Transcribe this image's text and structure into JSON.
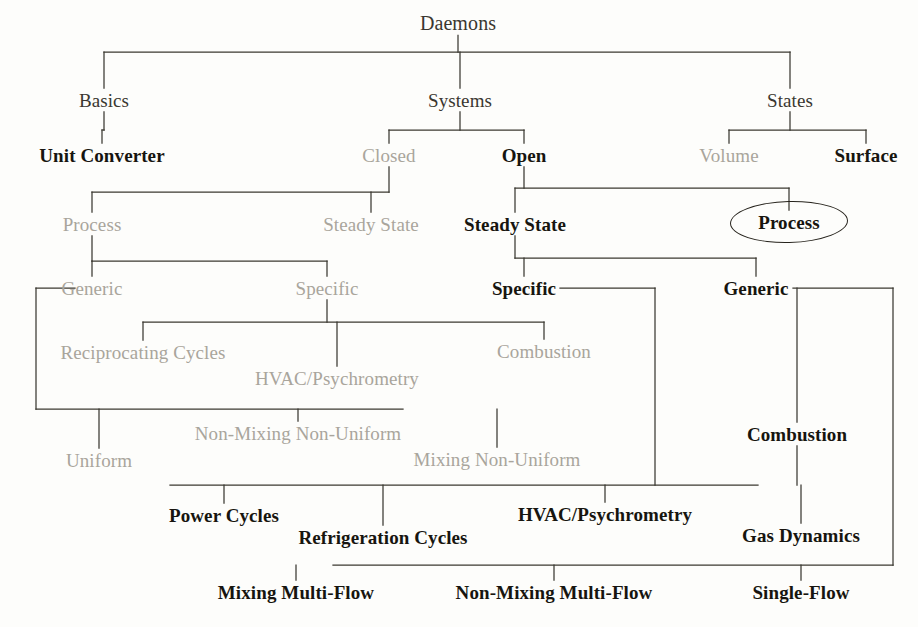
{
  "diagram": {
    "title": "Daemons",
    "type": "hierarchy-tree",
    "root_label": "Daemons",
    "highlighted_node": "Process",
    "colors": {
      "active_text": "#17150f",
      "dim_text": "#a9a59c",
      "root_text": "#3a3730",
      "line": "#3b3830",
      "background": "#fdfdfb",
      "highlight_ring": "#26231c"
    },
    "nodes": [
      {
        "id": "daemons",
        "label": "Daemons",
        "state": "root",
        "x": 458,
        "y": 23,
        "size": 20
      },
      {
        "id": "basics",
        "label": "Basics",
        "state": "root",
        "x": 104,
        "y": 100,
        "size": 19
      },
      {
        "id": "systems",
        "label": "Systems",
        "state": "root",
        "x": 460,
        "y": 100,
        "size": 19
      },
      {
        "id": "states",
        "label": "States",
        "state": "root",
        "x": 790,
        "y": 100,
        "size": 19
      },
      {
        "id": "unit-converter",
        "label": "Unit Converter",
        "state": "active",
        "x": 102,
        "y": 155,
        "size": 19
      },
      {
        "id": "closed",
        "label": "Closed",
        "state": "dim",
        "x": 389,
        "y": 155,
        "size": 19
      },
      {
        "id": "open",
        "label": "Open",
        "state": "active",
        "x": 524,
        "y": 155,
        "size": 19
      },
      {
        "id": "volume",
        "label": "Volume",
        "state": "dim",
        "x": 729,
        "y": 155,
        "size": 19
      },
      {
        "id": "surface",
        "label": "Surface",
        "state": "active",
        "x": 866,
        "y": 155,
        "size": 19
      },
      {
        "id": "closed-process",
        "label": "Process",
        "state": "dim",
        "x": 92,
        "y": 224,
        "size": 19
      },
      {
        "id": "closed-steady",
        "label": "Steady State",
        "state": "dim",
        "x": 371,
        "y": 224,
        "size": 19
      },
      {
        "id": "open-steady",
        "label": "Steady State",
        "state": "active",
        "x": 515,
        "y": 224,
        "size": 19
      },
      {
        "id": "open-process",
        "label": "Process",
        "state": "active",
        "x": 789,
        "y": 222,
        "size": 19
      },
      {
        "id": "cp-generic",
        "label": "Generic",
        "state": "dim",
        "x": 92,
        "y": 288,
        "size": 19
      },
      {
        "id": "cp-specific",
        "label": "Specific",
        "state": "dim",
        "x": 327,
        "y": 288,
        "size": 19
      },
      {
        "id": "os-specific",
        "label": "Specific",
        "state": "active",
        "x": 524,
        "y": 288,
        "size": 19
      },
      {
        "id": "os-generic",
        "label": "Generic",
        "state": "active",
        "x": 756,
        "y": 288,
        "size": 19
      },
      {
        "id": "recip-cycles",
        "label": "Reciprocating Cycles",
        "state": "dim",
        "x": 143,
        "y": 352,
        "size": 19
      },
      {
        "id": "hvac-closed",
        "label": "HVAC/Psychrometry",
        "state": "dim",
        "x": 337,
        "y": 378,
        "size": 19
      },
      {
        "id": "combustion-cs",
        "label": "Combustion",
        "state": "dim",
        "x": 544,
        "y": 351,
        "size": 19
      },
      {
        "id": "uniform",
        "label": "Uniform",
        "state": "dim",
        "x": 99,
        "y": 460,
        "size": 19
      },
      {
        "id": "nonmix-nonuni",
        "label": "Non-Mixing Non-Uniform",
        "state": "dim",
        "x": 298,
        "y": 433,
        "size": 19
      },
      {
        "id": "mix-nonuni",
        "label": "Mixing Non-Uniform",
        "state": "dim",
        "x": 497,
        "y": 459,
        "size": 19
      },
      {
        "id": "combustion-og",
        "label": "Combustion",
        "state": "active",
        "x": 797,
        "y": 434,
        "size": 19
      },
      {
        "id": "power-cycles",
        "label": "Power Cycles",
        "state": "active",
        "x": 224,
        "y": 515,
        "size": 19
      },
      {
        "id": "refrig-cycles",
        "label": "Refrigeration Cycles",
        "state": "active",
        "x": 383,
        "y": 537,
        "size": 19
      },
      {
        "id": "hvac-open",
        "label": "HVAC/Psychrometry",
        "state": "active",
        "x": 605,
        "y": 514,
        "size": 19
      },
      {
        "id": "gas-dynamics",
        "label": "Gas Dynamics",
        "state": "active",
        "x": 801,
        "y": 535,
        "size": 19
      },
      {
        "id": "mix-multiflow",
        "label": "Mixing Multi-Flow",
        "state": "active",
        "x": 296,
        "y": 592,
        "size": 19
      },
      {
        "id": "nonmix-multi",
        "label": "Non-Mixing Multi-Flow",
        "state": "active",
        "x": 554,
        "y": 592,
        "size": 19
      },
      {
        "id": "single-flow",
        "label": "Single-Flow",
        "state": "active",
        "x": 801,
        "y": 592,
        "size": 19
      }
    ],
    "edges": [
      {
        "from": "daemons",
        "to": "basics"
      },
      {
        "from": "daemons",
        "to": "systems"
      },
      {
        "from": "daemons",
        "to": "states"
      },
      {
        "from": "basics",
        "to": "unit-converter"
      },
      {
        "from": "systems",
        "to": "closed"
      },
      {
        "from": "systems",
        "to": "open"
      },
      {
        "from": "states",
        "to": "volume"
      },
      {
        "from": "states",
        "to": "surface"
      },
      {
        "from": "closed",
        "to": "closed-process"
      },
      {
        "from": "closed",
        "to": "closed-steady"
      },
      {
        "from": "open",
        "to": "open-steady"
      },
      {
        "from": "open",
        "to": "open-process"
      },
      {
        "from": "closed-process",
        "to": "cp-generic"
      },
      {
        "from": "closed-process",
        "to": "cp-specific"
      },
      {
        "from": "open-steady",
        "to": "os-specific"
      },
      {
        "from": "open-steady",
        "to": "os-generic"
      },
      {
        "from": "cp-specific",
        "to": "recip-cycles"
      },
      {
        "from": "cp-specific",
        "to": "hvac-closed"
      },
      {
        "from": "cp-specific",
        "to": "combustion-cs"
      },
      {
        "from": "cp-generic",
        "to": "uniform"
      },
      {
        "from": "cp-generic",
        "to": "nonmix-nonuni"
      },
      {
        "from": "cp-generic",
        "to": "mix-nonuni"
      },
      {
        "from": "os-specific",
        "to": "power-cycles"
      },
      {
        "from": "os-specific",
        "to": "refrig-cycles"
      },
      {
        "from": "os-specific",
        "to": "hvac-open"
      },
      {
        "from": "os-generic",
        "to": "combustion-og"
      },
      {
        "from": "combustion-og",
        "to": "gas-dynamics"
      },
      {
        "from": "os-generic",
        "to": "mix-multiflow"
      },
      {
        "from": "os-generic",
        "to": "nonmix-multi"
      },
      {
        "from": "os-generic",
        "to": "single-flow"
      }
    ],
    "highlight": {
      "label": "Process",
      "shape": "ellipse",
      "cx": 789,
      "cy": 222,
      "rx": 58,
      "ry": 20
    }
  }
}
